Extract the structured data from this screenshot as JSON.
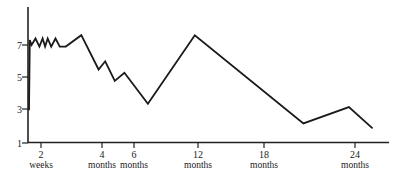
{
  "chart_data": {
    "type": "line",
    "title": "",
    "xlabel": "",
    "ylabel": "",
    "ylim": [
      1,
      8
    ],
    "grid": false,
    "legend": null,
    "y_ticks": [
      1,
      3,
      5,
      7
    ],
    "x_ticks": [
      {
        "value": "2",
        "unit": "weeks"
      },
      {
        "value": "4",
        "unit": "months"
      },
      {
        "value": "6",
        "unit": "months"
      },
      {
        "value": "12",
        "unit": "months"
      },
      {
        "value": "18",
        "unit": "months"
      },
      {
        "value": "24",
        "unit": "months"
      }
    ],
    "series": [
      {
        "name": "value",
        "x_months": [
          0.0,
          0.03,
          0.1,
          0.25,
          0.4,
          0.55,
          0.7,
          0.85,
          1.05,
          1.3,
          1.55,
          1.9,
          2.8,
          3.8,
          4.2,
          4.8,
          5.4,
          7.3,
          11.7,
          20.6,
          23.6,
          25.6
        ],
        "values": [
          3.0,
          7.3,
          7.0,
          7.4,
          6.9,
          7.4,
          6.9,
          7.4,
          6.9,
          7.4,
          6.9,
          6.9,
          7.6,
          5.5,
          6.0,
          4.8,
          5.3,
          3.4,
          7.6,
          2.2,
          3.2,
          1.9
        ]
      }
    ]
  },
  "axes": {
    "y_labels": [
      "7",
      "5",
      "3",
      "1"
    ],
    "x_numbers": [
      "2",
      "4",
      "6",
      "12",
      "18",
      "24"
    ],
    "x_units": [
      "weeks",
      "months",
      "months",
      "months",
      "months",
      "months"
    ]
  }
}
